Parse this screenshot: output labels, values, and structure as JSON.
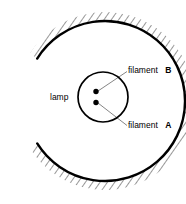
{
  "figure": {
    "background": "#ffffff",
    "stroke_color": "#000000",
    "hatch_color": "#1a1a1a",
    "leader_color": "#555555",
    "width": 186,
    "height": 204
  },
  "labels": {
    "lamp": "lamp",
    "filament_b_text": "filament",
    "filament_b_id": "B",
    "filament_a_text": "filament",
    "filament_a_id": "A"
  },
  "diagram_data": {
    "type": "schematic",
    "reflector": {
      "shape": "concave-arc",
      "opening_direction": "right",
      "hatching": "outer-side",
      "arc_center": [
        105,
        101
      ],
      "arc_radius": 80,
      "start_angle_deg": 212,
      "end_angle_deg": 148
    },
    "lamp_bulb": {
      "shape": "circle",
      "center": [
        103,
        97
      ],
      "radius": 25
    },
    "filaments": [
      {
        "id": "B",
        "position": [
          96,
          92
        ],
        "radius": 2.6
      },
      {
        "id": "A",
        "position": [
          96,
          102
        ],
        "radius": 2.6
      }
    ],
    "leader_lines": [
      {
        "from": [
          98,
          91
        ],
        "to": [
          128,
          71
        ],
        "label": "filament B"
      },
      {
        "from": [
          98,
          103
        ],
        "to": [
          128,
          126
        ],
        "label": "filament A"
      }
    ]
  }
}
